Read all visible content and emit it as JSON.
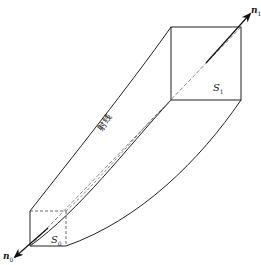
{
  "diagram": {
    "type": "ray tube (flux tube) perspective illustration",
    "ray_label": "射线",
    "normal_end": {
      "symbol": "n",
      "subscript": "1"
    },
    "normal_start": {
      "symbol": "n",
      "subscript": "0"
    },
    "area_end": {
      "symbol": "S",
      "subscript": "1"
    },
    "area_start": {
      "symbol": "S",
      "subscript": "0"
    },
    "colors": {
      "stroke": "#222222",
      "background": "#ffffff"
    }
  }
}
